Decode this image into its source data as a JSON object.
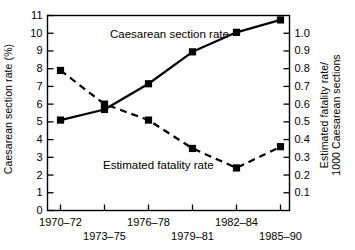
{
  "chart_data": {
    "type": "line",
    "title": "",
    "categories": [
      "1970–72",
      "1973–75",
      "1976–78",
      "1979–81",
      "1982–84",
      "1985–90"
    ],
    "xlabel": "",
    "grid": false,
    "legend_position": "inline-annotations",
    "axes": {
      "left": {
        "label": "Caesarean section rate (%)",
        "ylim": [
          0,
          11
        ],
        "ticks": [
          0,
          1,
          2,
          3,
          4,
          5,
          6,
          7,
          8,
          9,
          10,
          11
        ],
        "tick_labels": [
          "0",
          "1",
          "2",
          "3",
          "4",
          "5",
          "6",
          "7",
          "8",
          "9",
          "10",
          "11"
        ]
      },
      "right": {
        "label_line1": "Estimated fatality rate/",
        "label_line2": "1000 Caesarean sections",
        "ylim": [
          0,
          1.1
        ],
        "ticks": [
          0.1,
          0.2,
          0.3,
          0.4,
          0.5,
          0.6,
          0.7,
          0.8,
          0.9,
          1.0
        ],
        "tick_labels": [
          "0.1",
          "0.2",
          "0.3",
          "0.4",
          "0.5",
          "0.6",
          "0.7",
          "0.8",
          "0.9",
          "1.0"
        ]
      }
    },
    "series": [
      {
        "name": "Caesarean section rate",
        "axis": "left",
        "style": "solid",
        "marker": "square",
        "color": "#000000",
        "values": [
          5.1,
          5.7,
          7.15,
          8.95,
          10.05,
          10.75
        ]
      },
      {
        "name": "Estimated fatality rate",
        "axis": "right",
        "style": "dashed",
        "marker": "square",
        "color": "#000000",
        "values": [
          0.79,
          0.6,
          0.51,
          0.35,
          0.24,
          0.36
        ]
      }
    ],
    "annotations": [
      {
        "text": "Caesarean section rate",
        "x_px": 110,
        "y_px": 28
      },
      {
        "text": "Estimated fatality rate",
        "x_px": 103,
        "y_px": 159
      }
    ]
  }
}
